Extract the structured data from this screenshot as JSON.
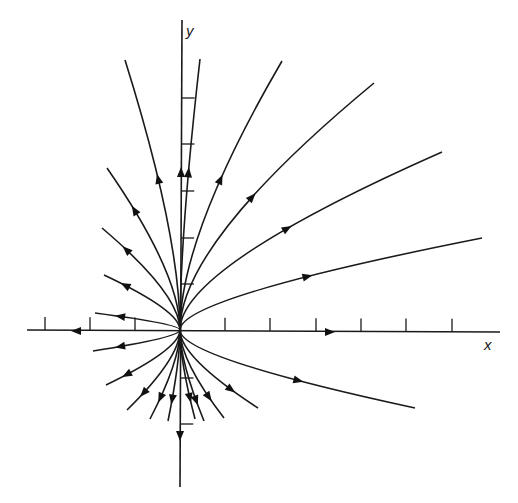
{
  "diagram": {
    "type": "phase-portrait",
    "colors": {
      "ink": "#1a1a1a",
      "background": "#ffffff"
    },
    "axes": {
      "x_label": "x",
      "y_label": "y",
      "origin": [
        180,
        330
      ],
      "x_ticks_px": [
        45,
        90,
        135,
        225,
        270,
        316,
        361,
        406,
        452
      ],
      "y_ticks_px": [
        98,
        144,
        191,
        238,
        284,
        378,
        424
      ]
    },
    "trajectories": [
      {
        "id": "t-up-left-1",
        "end": [
          125,
          60
        ],
        "arrow": [
          157,
          180
        ],
        "direction": "outward"
      },
      {
        "id": "t-up-left-2",
        "end": [
          107,
          168
        ],
        "arrow": [
          134,
          210
        ],
        "direction": "outward"
      },
      {
        "id": "t-up-left-3",
        "end": [
          102,
          228
        ],
        "arrow": [
          126,
          250
        ],
        "direction": "outward"
      },
      {
        "id": "t-up-left-4",
        "end": [
          104,
          275
        ],
        "arrow": [
          125,
          287
        ],
        "direction": "outward"
      },
      {
        "id": "t-up-left-5",
        "end": [
          95,
          313
        ],
        "arrow": [
          120,
          318
        ],
        "direction": "outward"
      },
      {
        "id": "t-up-near",
        "end": [
          200,
          59
        ],
        "arrow": [
          190,
          172
        ],
        "direction": "outward"
      },
      {
        "id": "t-up-right-1",
        "end": [
          282,
          61
        ],
        "arrow": [
          224,
          182
        ],
        "direction": "outward"
      },
      {
        "id": "t-up-right-2",
        "end": [
          374,
          83
        ],
        "arrow": [
          257,
          200
        ],
        "direction": "outward"
      },
      {
        "id": "t-up-right-3",
        "end": [
          442,
          152
        ],
        "arrow": [
          291,
          232
        ],
        "direction": "outward"
      },
      {
        "id": "t-up-right-4",
        "end": [
          482,
          238
        ],
        "arrow": [
          310,
          280
        ],
        "direction": "outward"
      },
      {
        "id": "t-down-left-1",
        "end": [
          93,
          351
        ],
        "arrow": [
          120,
          346
        ],
        "direction": "outward"
      },
      {
        "id": "t-down-left-2",
        "end": [
          106,
          385
        ],
        "arrow": [
          126,
          374
        ],
        "direction": "outward"
      },
      {
        "id": "t-down-left-3",
        "end": [
          127,
          410
        ],
        "arrow": [
          142,
          392
        ],
        "direction": "outward"
      },
      {
        "id": "t-down-left-4",
        "end": [
          150,
          419
        ],
        "arrow": [
          159,
          397
        ],
        "direction": "outward"
      },
      {
        "id": "t-down-left-5",
        "end": [
          168,
          421
        ],
        "arrow": [
          171,
          399
        ],
        "direction": "outward"
      },
      {
        "id": "t-down-right-1",
        "end": [
          195,
          419
        ],
        "arrow": [
          191,
          398
        ],
        "direction": "outward"
      },
      {
        "id": "t-down-right-2",
        "end": [
          204,
          421
        ],
        "arrow": [
          200,
          399
        ],
        "direction": "outward"
      },
      {
        "id": "t-down-right-3",
        "end": [
          224,
          418
        ],
        "arrow": [
          214,
          394
        ],
        "direction": "outward"
      },
      {
        "id": "t-down-right-4",
        "end": [
          258,
          408
        ],
        "arrow": [
          235,
          385
        ],
        "direction": "outward"
      },
      {
        "id": "t-down-right-5",
        "end": [
          415,
          408
        ],
        "arrow": [
          300,
          378
        ],
        "direction": "outward"
      }
    ],
    "axis_arrows": [
      {
        "id": "y-axis-up-arrow",
        "at": [
          181,
          172
        ],
        "direction": "up"
      },
      {
        "id": "y-axis-down-arrow",
        "at": [
          180,
          436
        ],
        "direction": "down"
      },
      {
        "id": "x-axis-left-arrow",
        "at": [
          76,
          331
        ],
        "direction": "left"
      },
      {
        "id": "x-axis-right-arrow",
        "at": [
          330,
          332
        ],
        "direction": "right"
      }
    ]
  }
}
